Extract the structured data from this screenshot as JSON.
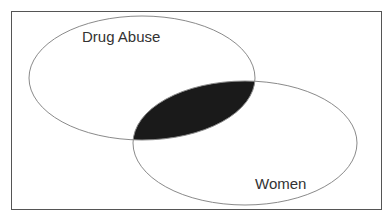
{
  "diagram": {
    "type": "venn",
    "sets": [
      {
        "label": "Drug Abuse",
        "cx": 142,
        "cy": 78,
        "rx": 113,
        "ry": 62,
        "label_x": 82,
        "label_y": 42
      },
      {
        "label": "Women",
        "cx": 245,
        "cy": 143,
        "rx": 112,
        "ry": 62,
        "label_x": 255,
        "label_y": 189
      }
    ],
    "intersection": {
      "fill": "#1a1a1a",
      "highlighted": true
    },
    "colors": {
      "outline": "#8a8a8a",
      "frame": "#555555",
      "text": "#333333",
      "background": "#ffffff"
    }
  }
}
